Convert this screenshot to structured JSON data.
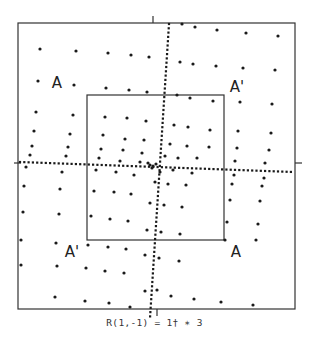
{
  "figure": {
    "caption": "R(1,-1) = 1† ∗ 3",
    "ink_color": "#1a1a1a",
    "outer_box": {
      "x1": 18,
      "y1": 23,
      "x2": 295,
      "y2": 309
    },
    "inner_box": {
      "x1": 87,
      "y1": 95,
      "x2": 224,
      "y2": 240
    },
    "ticks": [
      {
        "x1": 153,
        "y1": 16,
        "x2": 153,
        "y2": 23
      },
      {
        "x1": 14,
        "y1": 163,
        "x2": 21,
        "y2": 163
      },
      {
        "x1": 295,
        "y1": 163,
        "x2": 302,
        "y2": 163
      },
      {
        "x1": 157,
        "y1": 309,
        "x2": 157,
        "y2": 316
      }
    ],
    "region_labels": [
      {
        "text": "A",
        "x": 57,
        "y": 88
      },
      {
        "text": "A'",
        "x": 237,
        "y": 92
      },
      {
        "text": "A'",
        "x": 72,
        "y": 257
      },
      {
        "text": "A",
        "x": 236,
        "y": 257
      }
    ],
    "horizontal_dotted_axis": {
      "y_left": 162,
      "y_right": 172,
      "x_start": 20,
      "x_end": 293,
      "step": 4.3
    },
    "vertical_dotted_axis": {
      "x_top": 169,
      "x_bottom": 150,
      "y_start": 24,
      "y_end": 318,
      "step": 4.3
    },
    "dots": [
      [
        40,
        49
      ],
      [
        76,
        51
      ],
      [
        108,
        53
      ],
      [
        131,
        55
      ],
      [
        149,
        57
      ],
      [
        182,
        24
      ],
      [
        195,
        27
      ],
      [
        217,
        30
      ],
      [
        246,
        33
      ],
      [
        278,
        36
      ],
      [
        38,
        81
      ],
      [
        74,
        85
      ],
      [
        106,
        88
      ],
      [
        129,
        90
      ],
      [
        147,
        92
      ],
      [
        180,
        62
      ],
      [
        193,
        64
      ],
      [
        216,
        66
      ],
      [
        243,
        68
      ],
      [
        275,
        70
      ],
      [
        36,
        112
      ],
      [
        73,
        115
      ],
      [
        105,
        117
      ],
      [
        127,
        118
      ],
      [
        146,
        121
      ],
      [
        177,
        95
      ],
      [
        190,
        98
      ],
      [
        213,
        101
      ],
      [
        240,
        102
      ],
      [
        272,
        104
      ],
      [
        34,
        131
      ],
      [
        70,
        134
      ],
      [
        103,
        135
      ],
      [
        125,
        139
      ],
      [
        144,
        140
      ],
      [
        174,
        125
      ],
      [
        188,
        127
      ],
      [
        210,
        130
      ],
      [
        238,
        131
      ],
      [
        271,
        133
      ],
      [
        32,
        146
      ],
      [
        68,
        147
      ],
      [
        101,
        149
      ],
      [
        123,
        150
      ],
      [
        142,
        153
      ],
      [
        170,
        144
      ],
      [
        187,
        146
      ],
      [
        209,
        147
      ],
      [
        237,
        148
      ],
      [
        269,
        150
      ],
      [
        30,
        155
      ],
      [
        66,
        156
      ],
      [
        99,
        158
      ],
      [
        120,
        161
      ],
      [
        140,
        162
      ],
      [
        165,
        156
      ],
      [
        178,
        158
      ],
      [
        197,
        158
      ],
      [
        235,
        161
      ],
      [
        265,
        163
      ],
      [
        26,
        167
      ],
      [
        62,
        172
      ],
      [
        96,
        170
      ],
      [
        116,
        172
      ],
      [
        134,
        175
      ],
      [
        160,
        172
      ],
      [
        173,
        170
      ],
      [
        192,
        173
      ],
      [
        234,
        175
      ],
      [
        264,
        178
      ],
      [
        24,
        186
      ],
      [
        60,
        189
      ],
      [
        94,
        191
      ],
      [
        114,
        192
      ],
      [
        131,
        194
      ],
      [
        155,
        182
      ],
      [
        168,
        184
      ],
      [
        186,
        185
      ],
      [
        232,
        184
      ],
      [
        262,
        186
      ],
      [
        23,
        212
      ],
      [
        59,
        214
      ],
      [
        91,
        216
      ],
      [
        110,
        219
      ],
      [
        128,
        221
      ],
      [
        150,
        203
      ],
      [
        164,
        205
      ],
      [
        182,
        207
      ],
      [
        230,
        200
      ],
      [
        260,
        201
      ],
      [
        21,
        240
      ],
      [
        56,
        243
      ],
      [
        88,
        245
      ],
      [
        108,
        247
      ],
      [
        126,
        249
      ],
      [
        147,
        230
      ],
      [
        161,
        232
      ],
      [
        180,
        234
      ],
      [
        227,
        222
      ],
      [
        258,
        224
      ],
      [
        21,
        265
      ],
      [
        57,
        266
      ],
      [
        86,
        268
      ],
      [
        105,
        271
      ],
      [
        124,
        273
      ],
      [
        145,
        255
      ],
      [
        159,
        258
      ],
      [
        179,
        261
      ],
      [
        225,
        240
      ],
      [
        256,
        240
      ],
      [
        55,
        297
      ],
      [
        85,
        301
      ],
      [
        109,
        303
      ],
      [
        130,
        307
      ],
      [
        145,
        291
      ],
      [
        157,
        290
      ],
      [
        171,
        296
      ],
      [
        194,
        299
      ],
      [
        221,
        302
      ],
      [
        253,
        305
      ],
      [
        150,
        165
      ],
      [
        153,
        166
      ],
      [
        156,
        164
      ],
      [
        152,
        168
      ],
      [
        148,
        163
      ]
    ]
  }
}
